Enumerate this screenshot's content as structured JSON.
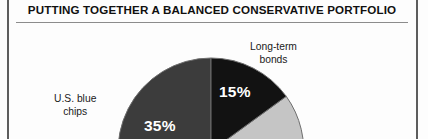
{
  "figure": {
    "title": "PUTTING TOGETHER A BALANCED CONSERVATIVE PORTFOLIO"
  },
  "chart_data": {
    "type": "pie",
    "title": "PUTTING TOGETHER A BALANCED CONSERVATIVE PORTFOLIO",
    "xlabel": "",
    "ylabel": "",
    "legend": "none",
    "grid": false,
    "units": "percent",
    "categories": [
      "Long-term bonds",
      "U.S. blue chips"
    ],
    "values": [
      15,
      35
    ],
    "labels": [
      "15%",
      "35%"
    ],
    "slices": [
      {
        "name": "Long-term bonds",
        "label_line1": "Long-term",
        "label_line2": "bonds",
        "value": 15,
        "value_label": "15%",
        "color": "#121212",
        "start_angle_deg": 0,
        "end_angle_deg": 54
      },
      {
        "name": "U.S. blue chips",
        "label_line1": "U.S. blue",
        "label_line2": "chips",
        "value": 35,
        "value_label": "35%",
        "color": "#3c3c3c",
        "start_angle_deg": 234,
        "end_angle_deg": 360
      },
      {
        "name": "unlabeled-slice",
        "label_line1": "",
        "label_line2": "",
        "value": null,
        "value_label": "",
        "color": "#c5c5c5",
        "start_angle_deg": 54,
        "end_angle_deg": 234
      }
    ],
    "colors": {
      "bonds": "#121212",
      "blue_chips": "#3c3c3c",
      "third": "#c5c5c5",
      "outline": "#6e6e6e",
      "value_text": "#ffffff",
      "callout_text": "#1a1a1a",
      "rule": "#8c8c8c",
      "column_rule": "#5d5d5d",
      "background": "#fdfdfd"
    },
    "geometry": {
      "center_x": 211,
      "center_y": 151,
      "radius": 93
    }
  }
}
